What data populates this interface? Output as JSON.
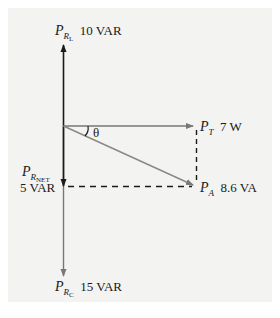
{
  "diagram": {
    "colors": {
      "background": "#f3f3f2",
      "black_arrow": "#1a1a1a",
      "gray_arrow": "#777777"
    },
    "labels": {
      "prl": {
        "symbol": "P",
        "sub": "R",
        "subsub": "L",
        "value": "10 VAR"
      },
      "pt": {
        "symbol": "P",
        "sub": "T",
        "value": "7 W"
      },
      "prnet": {
        "symbol": "P",
        "sub": "R",
        "subsub": "NET",
        "value": "5 VAR"
      },
      "pa": {
        "symbol": "P",
        "sub": "A",
        "value": "8.6 VA"
      },
      "prc": {
        "symbol": "P",
        "sub": "R",
        "subsub": "C",
        "value": "15 VAR"
      },
      "angle": "θ"
    },
    "vectors": [
      {
        "name": "P_RL",
        "direction": "up",
        "magnitude": "10 VAR",
        "color": "black"
      },
      {
        "name": "P_T",
        "direction": "right",
        "magnitude": "7 W",
        "color": "gray"
      },
      {
        "name": "P_RNET",
        "direction": "down",
        "magnitude": "5 VAR",
        "color": "black"
      },
      {
        "name": "P_A",
        "direction": "diagonal down-right",
        "magnitude": "8.6 VA",
        "color": "gray"
      },
      {
        "name": "P_RC",
        "direction": "down",
        "magnitude": "15 VAR",
        "color": "gray"
      }
    ]
  }
}
